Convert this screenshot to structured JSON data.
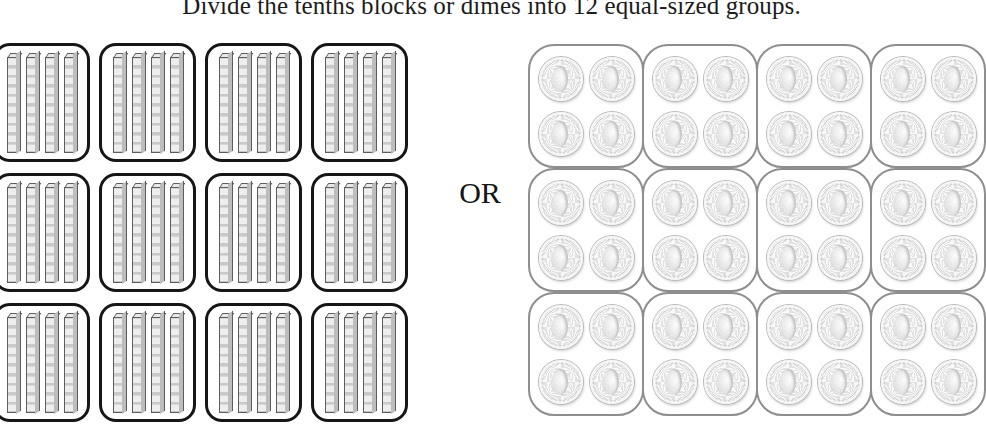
{
  "title": "Divide the tenths blocks or dimes into 12 equal-sized groups.",
  "connector_label": "OR",
  "colors": {
    "block_outline": "#161616",
    "block_fill": "#e8e8e8",
    "coin_outline": "#8e8e8e",
    "coin_fill": "#f5f5f5",
    "text": "#1c1c1c",
    "background": "#ffffff"
  },
  "blocks_panel": {
    "name": "tenths-blocks",
    "group_count": 12,
    "grid_columns": 4,
    "grid_rows": 3,
    "rods_per_group": 4,
    "units_per_rod": 10,
    "groups": [
      {
        "index": 1,
        "rods": 4
      },
      {
        "index": 2,
        "rods": 4
      },
      {
        "index": 3,
        "rods": 4
      },
      {
        "index": 4,
        "rods": 4
      },
      {
        "index": 5,
        "rods": 4
      },
      {
        "index": 6,
        "rods": 4
      },
      {
        "index": 7,
        "rods": 4
      },
      {
        "index": 8,
        "rods": 4
      },
      {
        "index": 9,
        "rods": 4
      },
      {
        "index": 10,
        "rods": 4
      },
      {
        "index": 11,
        "rods": 4
      },
      {
        "index": 12,
        "rods": 4
      }
    ]
  },
  "coins_panel": {
    "name": "dimes",
    "group_count": 12,
    "grid_columns": 4,
    "grid_rows": 3,
    "coins_per_group": 4,
    "coin_layout": "2x2",
    "groups": [
      {
        "index": 1,
        "coins": 4
      },
      {
        "index": 2,
        "coins": 4
      },
      {
        "index": 3,
        "coins": 4
      },
      {
        "index": 4,
        "coins": 4
      },
      {
        "index": 5,
        "coins": 4
      },
      {
        "index": 6,
        "coins": 4
      },
      {
        "index": 7,
        "coins": 4
      },
      {
        "index": 8,
        "coins": 4
      },
      {
        "index": 9,
        "coins": 4
      },
      {
        "index": 10,
        "coins": 4
      },
      {
        "index": 11,
        "coins": 4
      },
      {
        "index": 12,
        "coins": 4
      }
    ]
  }
}
